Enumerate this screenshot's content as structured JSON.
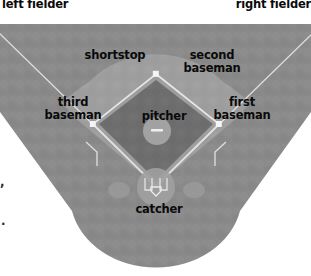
{
  "diagram": {
    "type": "baseball-field-diagram",
    "width": 311,
    "height": 276,
    "background_color": "#ffffff"
  },
  "colors": {
    "outfield_grass": "#8a8a8a",
    "infield_dirt": "#9e9e9e",
    "infield_grass": "#6e6e6e",
    "chalk_line": "#e8e8e8",
    "base_marker": "#f2f2f2",
    "mound_dirt": "#a6a6a6",
    "home_circle": "#a0a0a0",
    "on_deck_circle": "#9a9a9a",
    "label_text": "#0a0a0a",
    "page_background": "#ffffff"
  },
  "labels": {
    "left_fielder": "left fielder",
    "right_fielder": "right fielder",
    "shortstop": "shortstop",
    "second_baseman": "second\nbaseman",
    "third_baseman": "third\nbaseman",
    "first_baseman": "first\nbaseman",
    "pitcher": "pitcher",
    "catcher": "catcher"
  },
  "positions": [
    {
      "name": "left fielder",
      "label_x": 2,
      "label_y": -2,
      "lines": 1
    },
    {
      "name": "right fielder",
      "label_x": 207,
      "label_y": -2,
      "lines": 1
    },
    {
      "name": "shortstop",
      "label_x": 72,
      "label_y": 49,
      "lines": 1
    },
    {
      "name": "second baseman",
      "label_x": 168,
      "label_y": 49,
      "lines": 2
    },
    {
      "name": "third baseman",
      "label_x": 29,
      "label_y": 96,
      "lines": 2
    },
    {
      "name": "first baseman",
      "label_x": 198,
      "label_y": 96,
      "lines": 2
    },
    {
      "name": "pitcher",
      "label_x": 122,
      "label_y": 110,
      "lines": 1
    },
    {
      "name": "catcher",
      "label_x": 117,
      "label_y": 203,
      "lines": 1
    }
  ],
  "field_geometry": {
    "home_plate": {
      "x": 156,
      "y": 186
    },
    "first_base": {
      "x": 219,
      "y": 124
    },
    "second_base": {
      "x": 156,
      "y": 74
    },
    "third_base": {
      "x": 93,
      "y": 124
    },
    "pitchers_mound": {
      "x": 157,
      "y": 131,
      "radius": 14
    },
    "home_circle_radius": 19,
    "infield_arc_radius": 88,
    "on_deck_left": {
      "x": 119,
      "y": 190,
      "rx": 11,
      "ry": 8
    },
    "on_deck_right": {
      "x": 194,
      "y": 190,
      "rx": 11,
      "ry": 8
    }
  },
  "edge_artifacts": {
    "comma": ",",
    "period": "."
  }
}
